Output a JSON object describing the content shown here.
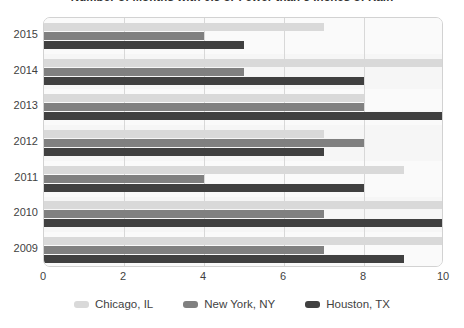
{
  "chart_data": {
    "type": "bar",
    "orientation": "horizontal",
    "title": "Number of Months with 0.5 or Fewer than 5 Inches of Rain",
    "xlabel": "",
    "ylabel": "",
    "categories": [
      "2015",
      "2014",
      "2013",
      "2012",
      "2011",
      "2010",
      "2009"
    ],
    "series": [
      {
        "name": "Chicago, IL",
        "color": "#d9d9d9",
        "values": [
          7,
          10,
          8,
          7,
          9,
          10,
          10
        ]
      },
      {
        "name": "New York, NY",
        "color": "#808080",
        "values": [
          4,
          5,
          8,
          8,
          4,
          7,
          7
        ]
      },
      {
        "name": "Houston, TX",
        "color": "#404040",
        "values": [
          5,
          8,
          10,
          7,
          8,
          10,
          9
        ]
      }
    ],
    "xticks": [
      "0",
      "2",
      "4",
      "6",
      "8",
      "10"
    ],
    "xtick_values": [
      0,
      2,
      4,
      6,
      8,
      10
    ],
    "xlim": [
      0,
      10
    ],
    "grid": true,
    "grid_axis": "x",
    "legend_position": "bottom"
  },
  "colors": {
    "chicago": "#d9d9d9",
    "new_york": "#808080",
    "houston": "#404040",
    "gridline": "#d8d8d8",
    "plot_border": "#d2d2d2",
    "text": "#3f3f3f",
    "background": "#ffffff"
  }
}
